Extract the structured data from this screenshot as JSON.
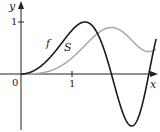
{
  "chart_data": {
    "type": "line",
    "title": "",
    "xlabel": "x",
    "ylabel": "y",
    "origin_label": "0",
    "x_ticks": [
      {
        "value": 1,
        "label": "1"
      }
    ],
    "y_ticks": [
      {
        "value": 1,
        "label": "1"
      }
    ],
    "xlim": [
      0,
      2.65
    ],
    "ylim": [
      -1,
      1.3
    ],
    "grid": false,
    "series": [
      {
        "name": "f",
        "formula": "sin(x^2)",
        "color": "#1a1a1a"
      },
      {
        "name": "S",
        "formula": "integral from 0 to x of sin(t^2) dt",
        "color": "#a8a8a8"
      }
    ],
    "annotations": [
      {
        "text": "f",
        "near_x": 0.7
      },
      {
        "text": "S",
        "near_x": 0.85
      }
    ]
  }
}
